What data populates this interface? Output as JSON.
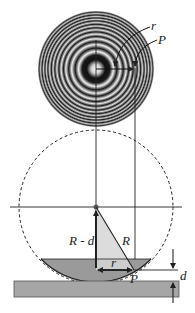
{
  "diagram": {
    "type": "Newton's rings geometry",
    "labels": {
      "r_top": "r",
      "P_top": "P",
      "R_minus_d": "R - d",
      "R": "R",
      "r_bottom": "r",
      "P_bottom": "P",
      "d": "d"
    },
    "colors": {
      "ring_dark": "#1a1a1a",
      "ring_light": "#e6e6e6",
      "liquid_fill": "#9a9a9a",
      "triangle_fill": "#d6d6d6",
      "slab_fill": "#a6a6a6",
      "line": "#222222"
    }
  }
}
